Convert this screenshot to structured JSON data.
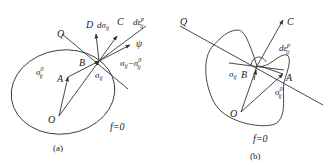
{
  "panels": [
    {
      "id": "a",
      "caption": "(a)",
      "surface_label": "f=0",
      "labels": {
        "Q": "Q",
        "D": "D",
        "dsigma": "dσ",
        "dsigma_sub": "ij",
        "C": "C",
        "deps": "dε",
        "deps_sup": "p",
        "deps_sub": "ij",
        "psi": "ψ",
        "B": "B",
        "A": "A",
        "O": "O",
        "sigma0": "σ",
        "sigma0_sup": "0",
        "sigma0_sub": "ij",
        "sigma": "σ",
        "sigma_sub": "ij",
        "diff": "σ",
        "diff_sub1": "ij",
        "diff_minus": "−σ",
        "diff_sup2": "0",
        "diff_sub2": "ij"
      }
    },
    {
      "id": "b",
      "caption": "(b)",
      "surface_label": "f=0",
      "labels": {
        "Q": "Q",
        "C": "C",
        "deps": "dε",
        "deps_sup": "p",
        "deps_sub": "ij",
        "sigma": "σ",
        "sigma_sub": "ij",
        "B": "B",
        "A": "A",
        "O": "O",
        "sigma0": "σ",
        "sigma0_sup": "0",
        "sigma0_sub": "ij"
      }
    }
  ]
}
